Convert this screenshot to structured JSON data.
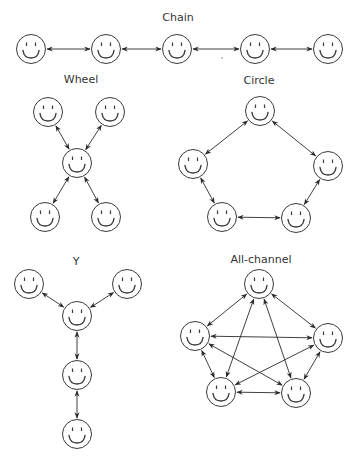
{
  "figure": {
    "width": 359,
    "height": 465,
    "face_radius": 14.5,
    "colors": {
      "stroke": "#3a3a3a",
      "edge": "#2a2a2a",
      "text": "#333333",
      "background": "#ffffff"
    }
  },
  "networks": [
    {
      "id": "chain",
      "title": "Chain",
      "label_pos": [
        178,
        21
      ],
      "nodes": [
        [
          31,
          49
        ],
        [
          106,
          49
        ],
        [
          177,
          49
        ],
        [
          255,
          49
        ],
        [
          328,
          49
        ]
      ],
      "edges": [
        [
          0,
          1
        ],
        [
          1,
          2
        ],
        [
          2,
          3
        ],
        [
          3,
          4
        ]
      ]
    },
    {
      "id": "wheel",
      "title": "Wheel",
      "label_pos": [
        81,
        83
      ],
      "nodes": [
        [
          48,
          112
        ],
        [
          110,
          112
        ],
        [
          77,
          163
        ],
        [
          45,
          217
        ],
        [
          106,
          217
        ]
      ],
      "edges": [
        [
          0,
          2
        ],
        [
          1,
          2
        ],
        [
          2,
          3
        ],
        [
          2,
          4
        ]
      ]
    },
    {
      "id": "circle",
      "title": "Circle",
      "label_pos": [
        259,
        84
      ],
      "nodes": [
        [
          260,
          111
        ],
        [
          193,
          164
        ],
        [
          328,
          166
        ],
        [
          222,
          217
        ],
        [
          296,
          218
        ]
      ],
      "edges": [
        [
          0,
          1
        ],
        [
          0,
          2
        ],
        [
          1,
          3
        ],
        [
          2,
          4
        ],
        [
          3,
          4
        ]
      ]
    },
    {
      "id": "y",
      "title": "Y",
      "label_pos": [
        76,
        265
      ],
      "nodes": [
        [
          29,
          284
        ],
        [
          127,
          284
        ],
        [
          77,
          316
        ],
        [
          77,
          375
        ],
        [
          77,
          434
        ]
      ],
      "edges": [
        [
          0,
          2
        ],
        [
          1,
          2
        ],
        [
          2,
          3
        ],
        [
          3,
          4
        ]
      ]
    },
    {
      "id": "all-channel",
      "title": "All-channel",
      "label_pos": [
        261,
        263
      ],
      "nodes": [
        [
          259,
          284
        ],
        [
          195,
          336
        ],
        [
          328,
          338
        ],
        [
          221,
          392
        ],
        [
          296,
          393
        ]
      ],
      "edges": [
        [
          0,
          1
        ],
        [
          0,
          2
        ],
        [
          0,
          3
        ],
        [
          0,
          4
        ],
        [
          1,
          2
        ],
        [
          1,
          3
        ],
        [
          1,
          4
        ],
        [
          2,
          3
        ],
        [
          2,
          4
        ],
        [
          3,
          4
        ]
      ]
    }
  ]
}
